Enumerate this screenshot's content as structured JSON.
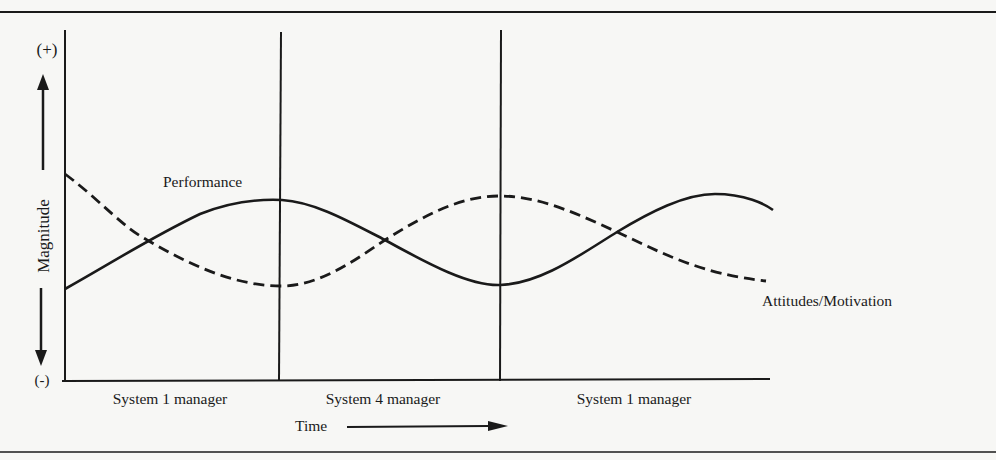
{
  "figure": {
    "y_axis": {
      "label": "Magnitude",
      "top_marker": "(+)",
      "bottom_marker": "(-)"
    },
    "x_axis": {
      "label": "Time"
    },
    "periods": [
      {
        "label": "System 1 manager"
      },
      {
        "label": "System 4 manager"
      },
      {
        "label": "System 1 manager"
      }
    ],
    "series": [
      {
        "name": "Performance",
        "style": "solid"
      },
      {
        "name": "Attitudes/Motivation",
        "style": "dashed"
      }
    ],
    "colors": {
      "ink": "#1a1a1a",
      "paper": "#f7f7f5"
    }
  }
}
